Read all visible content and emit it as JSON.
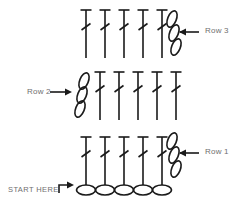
{
  "diagram": {
    "type": "crochet-stitch-chart",
    "title": "",
    "background_color": "#ffffff",
    "stroke_color": "#1a1a1a",
    "text_color": "#6f6f6f",
    "labels": {
      "row3": "Row 3",
      "row2": "Row 2",
      "row1": "Row 1",
      "start_here": "START HERE"
    },
    "foundation_chain": {
      "name": "foundation-chain",
      "symbol": "chain-oval",
      "count": 5,
      "orientation": "horizontal",
      "y": 190,
      "x_start": 82,
      "spacing": 19,
      "rx": 9.5,
      "ry": 5
    },
    "rows": [
      {
        "name": "row-1",
        "label": "Row 1",
        "stitch_symbol": "double-crochet",
        "stitch_count": 5,
        "turning_chain_count": 3,
        "turning_chain_side": "right",
        "direction": "right",
        "stem_top": 137,
        "stem_bottom": 185,
        "x_start": 86,
        "spacing": 19,
        "arrow_direction": "left"
      },
      {
        "name": "row-2",
        "label": "Row 2",
        "stitch_symbol": "double-crochet",
        "stitch_count": 5,
        "turning_chain_count": 3,
        "turning_chain_side": "left",
        "direction": "left",
        "stem_top": 72,
        "stem_bottom": 120,
        "x_start": 100,
        "spacing": 19,
        "arrow_direction": "right"
      },
      {
        "name": "row-3",
        "label": "Row 3",
        "stitch_symbol": "double-crochet",
        "stitch_count": 5,
        "turning_chain_count": 3,
        "turning_chain_side": "right",
        "direction": "right",
        "stem_top": 10,
        "stem_bottom": 58,
        "x_start": 86,
        "spacing": 19,
        "arrow_direction": "left"
      }
    ],
    "arrows": [
      {
        "name": "arrow-row3",
        "points": "left",
        "x1": 199,
        "x2": 176,
        "y": 32
      },
      {
        "name": "arrow-row1",
        "points": "left",
        "x1": 199,
        "x2": 176,
        "y": 153
      },
      {
        "name": "arrow-row2",
        "points": "right",
        "x1": 50,
        "x2": 73,
        "y": 92
      }
    ],
    "start_arrow": {
      "name": "start-here-arrow",
      "shape": "turn-right-arrow",
      "x": 59,
      "y": 184
    }
  }
}
